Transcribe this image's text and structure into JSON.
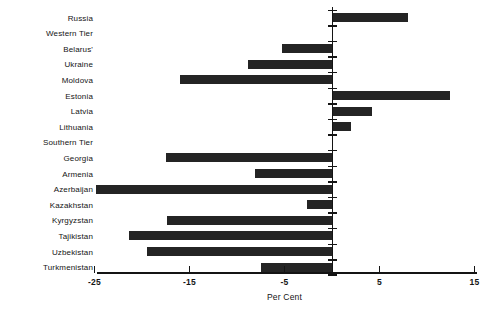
{
  "chart_data": {
    "type": "bar",
    "orientation": "horizontal",
    "title": "",
    "xlabel": "Per Cent",
    "ylabel": "",
    "xlim": [
      -25,
      15
    ],
    "xticks": [
      -25,
      -15,
      -5,
      5,
      15
    ],
    "xtick_labels": [
      "-25",
      "-15",
      "-5",
      "5",
      "15"
    ],
    "grid": false,
    "legend": null,
    "zero_line": 0,
    "categories": [
      "Russia",
      "Western Tier",
      "Belarus'",
      "Ukraine",
      "Moldova",
      "Estonia",
      "Latvia",
      "Lithuania",
      "Southern Tier",
      "Georgia",
      "Armenia",
      "Azerbaijan",
      "Kazakhstan",
      "Kyrgyzstan",
      "Tajikistan",
      "Uzbekistan",
      "Turkmenistan"
    ],
    "values": [
      8.0,
      0,
      -5.3,
      -8.8,
      -16.0,
      12.4,
      4.2,
      2.0,
      0,
      -17.5,
      -8.1,
      -24.8,
      -2.6,
      -17.4,
      -21.4,
      -19.5,
      -7.5
    ],
    "bar_color": "#242424"
  }
}
